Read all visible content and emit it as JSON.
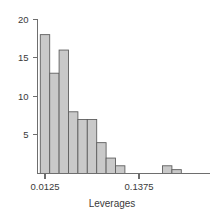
{
  "chart_data": {
    "type": "bar",
    "title": "",
    "subtitle": "",
    "xlabel": "Leverages",
    "ylabel": "",
    "grid": false,
    "legend": false,
    "legend_position": "none",
    "bar_style": "histogram",
    "bar_fill_color": "#c9c9c9",
    "bar_border_color": "#5f5f5f",
    "axis_color": "#6e6e6e",
    "text_color": "#3a3a3a",
    "xlim": [
      0.00625,
      0.19375
    ],
    "ylim": [
      0,
      21
    ],
    "xtick_values": [
      0.0125,
      0.1375
    ],
    "xtick_labels": [
      "0.0125",
      "0.1375"
    ],
    "ytick_values": [
      5,
      10,
      15,
      20
    ],
    "ytick_labels": [
      "5",
      "10",
      "15",
      "20"
    ],
    "bin_width": 0.0125,
    "bin_starts": [
      0.00625,
      0.01875,
      0.03125,
      0.04375,
      0.05625,
      0.06875,
      0.08125,
      0.09375,
      0.10625,
      0.11875,
      0.13125,
      0.14375,
      0.15625,
      0.16875,
      0.18125
    ],
    "categories": [
      "0.00625",
      "0.01875",
      "0.03125",
      "0.04375",
      "0.05625",
      "0.06875",
      "0.08125",
      "0.09375",
      "0.10625",
      "0.11875",
      "0.13125",
      "0.14375",
      "0.15625",
      "0.16875",
      "0.18125"
    ],
    "values": [
      18,
      13,
      16,
      8,
      7,
      7,
      4,
      2,
      1,
      0,
      0,
      0,
      0,
      1,
      0.5
    ],
    "bars": [
      {
        "bin_start": 0.00625,
        "bin_end": 0.01875,
        "count": 18
      },
      {
        "bin_start": 0.01875,
        "bin_end": 0.03125,
        "count": 13
      },
      {
        "bin_start": 0.03125,
        "bin_end": 0.04375,
        "count": 16
      },
      {
        "bin_start": 0.04375,
        "bin_end": 0.05625,
        "count": 8
      },
      {
        "bin_start": 0.05625,
        "bin_end": 0.06875,
        "count": 7
      },
      {
        "bin_start": 0.06875,
        "bin_end": 0.08125,
        "count": 7
      },
      {
        "bin_start": 0.08125,
        "bin_end": 0.09375,
        "count": 4
      },
      {
        "bin_start": 0.09375,
        "bin_end": 0.10625,
        "count": 2
      },
      {
        "bin_start": 0.10625,
        "bin_end": 0.11875,
        "count": 1
      },
      {
        "bin_start": 0.11875,
        "bin_end": 0.13125,
        "count": 0
      },
      {
        "bin_start": 0.13125,
        "bin_end": 0.14375,
        "count": 0
      },
      {
        "bin_start": 0.14375,
        "bin_end": 0.15625,
        "count": 0
      },
      {
        "bin_start": 0.15625,
        "bin_end": 0.16875,
        "count": 0
      },
      {
        "bin_start": 0.16875,
        "bin_end": 0.18125,
        "count": 1
      },
      {
        "bin_start": 0.18125,
        "bin_end": 0.19375,
        "count": 0.5
      }
    ]
  }
}
